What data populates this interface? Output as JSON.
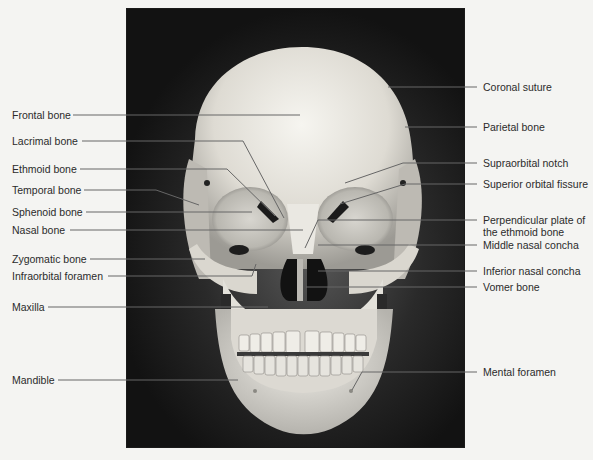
{
  "figure": {
    "photo_colors": {
      "background_dark": "#121212",
      "bone": "#e8e6e0",
      "shadow": "#3a3a3a"
    },
    "line_color": "#666666"
  },
  "labels_left": [
    {
      "id": "frontal-bone",
      "text": "Frontal bone",
      "y": 115,
      "line": [
        [
          73,
          115
        ],
        [
          300,
          115
        ]
      ]
    },
    {
      "id": "lacrimal-bone",
      "text": "Lacrimal bone",
      "y": 141,
      "line": [
        [
          82,
          141
        ],
        [
          243,
          141
        ],
        [
          284,
          218
        ]
      ]
    },
    {
      "id": "ethmoid-bone",
      "text": "Ethmoid bone",
      "y": 169,
      "line": [
        [
          80,
          169
        ],
        [
          227,
          169
        ],
        [
          275,
          216
        ]
      ]
    },
    {
      "id": "temporal-bone",
      "text": "Temporal bone",
      "y": 190,
      "line": [
        [
          84,
          190
        ],
        [
          156,
          190
        ],
        [
          199,
          205
        ]
      ]
    },
    {
      "id": "sphenoid-bone",
      "text": "Sphenoid bone",
      "y": 212,
      "line": [
        [
          86,
          212
        ],
        [
          252,
          212
        ]
      ]
    },
    {
      "id": "nasal-bone",
      "text": "Nasal bone",
      "y": 230,
      "line": [
        [
          70,
          230
        ],
        [
          303,
          230
        ]
      ]
    },
    {
      "id": "zygomatic-bone",
      "text": "Zygomatic bone",
      "y": 259,
      "line": [
        [
          90,
          259
        ],
        [
          205,
          259
        ]
      ]
    },
    {
      "id": "infraorbital-foramen",
      "text": "Infraorbital foramen",
      "y": 276,
      "line": [
        [
          108,
          276
        ],
        [
          252,
          276
        ],
        [
          256,
          264
        ]
      ]
    },
    {
      "id": "maxilla",
      "text": "Maxilla",
      "y": 307,
      "line": [
        [
          48,
          307
        ],
        [
          268,
          307
        ]
      ]
    },
    {
      "id": "mandible",
      "text": "Mandible",
      "y": 380,
      "line": [
        [
          58,
          380
        ],
        [
          238,
          380
        ]
      ]
    }
  ],
  "labels_right": [
    {
      "id": "coronal-suture",
      "text": "Coronal suture",
      "y": 87,
      "line": [
        [
          477,
          87
        ],
        [
          388,
          87
        ]
      ]
    },
    {
      "id": "parietal-bone",
      "text": "Parietal bone",
      "y": 127,
      "line": [
        [
          477,
          127
        ],
        [
          405,
          127
        ]
      ]
    },
    {
      "id": "supraorbital-notch",
      "text": "Supraorbital notch",
      "y": 163,
      "line": [
        [
          477,
          163
        ],
        [
          403,
          163
        ],
        [
          345,
          183
        ]
      ]
    },
    {
      "id": "superior-orbital-fissure",
      "text": "Superior orbital fissure",
      "y": 184,
      "line": [
        [
          477,
          184
        ],
        [
          405,
          184
        ],
        [
          340,
          204
        ]
      ]
    },
    {
      "id": "perpendicular-plate",
      "text": [
        "Perpendicular plate of",
        "the ethmoid bone"
      ],
      "y": 220,
      "line": [
        [
          477,
          220
        ],
        [
          318,
          220
        ],
        [
          305,
          248
        ]
      ]
    },
    {
      "id": "middle-nasal-concha",
      "text": "Middle nasal concha",
      "y": 245,
      "line": [
        [
          477,
          245
        ],
        [
          318,
          245
        ]
      ]
    },
    {
      "id": "inferior-nasal-concha",
      "text": "Inferior nasal concha",
      "y": 271,
      "line": [
        [
          477,
          271
        ],
        [
          318,
          271
        ]
      ]
    },
    {
      "id": "vomer-bone",
      "text": "Vomer bone",
      "y": 287,
      "line": [
        [
          477,
          287
        ],
        [
          306,
          287
        ]
      ]
    },
    {
      "id": "mental-foramen",
      "text": "Mental foramen",
      "y": 372,
      "line": [
        [
          477,
          372
        ],
        [
          362,
          372
        ],
        [
          352,
          390
        ]
      ]
    }
  ]
}
